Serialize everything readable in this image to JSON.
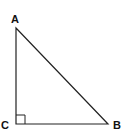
{
  "diagram": {
    "type": "right-triangle",
    "vertices": [
      {
        "id": "A",
        "label": "A",
        "x": 16,
        "y": 28
      },
      {
        "id": "B",
        "label": "B",
        "x": 108,
        "y": 124
      },
      {
        "id": "C",
        "label": "C",
        "x": 16,
        "y": 124
      }
    ],
    "right_angle_at": "C",
    "stroke_color": "#222222",
    "label_color": "#111111"
  }
}
